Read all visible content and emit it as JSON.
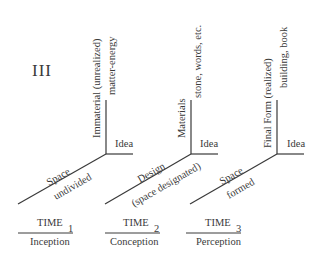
{
  "panel_label": "III",
  "axes": [
    {
      "vertical_label": "Immaterial (unrealized)",
      "vertical_sublabel": "matter-energy",
      "horizontal_label": "Idea",
      "diagonal_label": "Space",
      "diagonal_sublabel": "undivided"
    },
    {
      "vertical_label": "Materials",
      "vertical_sublabel": "stone, words, etc.",
      "horizontal_label": "Idea",
      "diagonal_label": "Design",
      "diagonal_sublabel": "(space designated)"
    },
    {
      "vertical_label": "Final Form (realized)",
      "vertical_sublabel": "building, book",
      "horizontal_label": "Idea",
      "diagonal_label": "Space",
      "diagonal_sublabel": "formed"
    }
  ],
  "times": [
    {
      "label": "TIME",
      "subscript": "1",
      "caption": "Inception"
    },
    {
      "label": "TIME",
      "subscript": "2",
      "caption": "Conception"
    },
    {
      "label": "TIME",
      "subscript": "3",
      "caption": "Perception"
    }
  ],
  "colors": {
    "line": "#3a3a3a",
    "text": "#3a3a3a",
    "background": "#ffffff"
  }
}
